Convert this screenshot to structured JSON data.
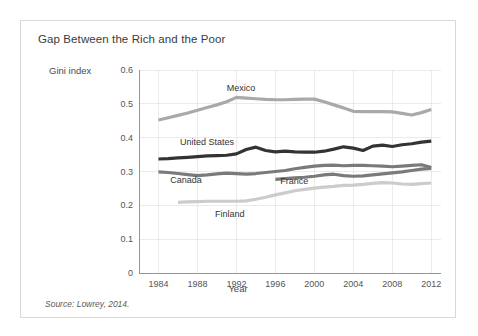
{
  "figure": {
    "title": "Gap Between the Rich and the Poor",
    "source": "Source: Lowrey, 2014."
  },
  "chart_data": {
    "type": "line",
    "title": "Gap Between the Rich and the Poor",
    "xlabel": "Year",
    "ylabel": "Gini index",
    "xlim": [
      1982,
      2013
    ],
    "ylim": [
      0,
      0.6
    ],
    "grid": true,
    "legend_position": "inline-labels",
    "xticks": [
      "1984",
      "1988",
      "1992",
      "1996",
      "2000",
      "2004",
      "2008",
      "2012"
    ],
    "xtick_values": [
      1984,
      1988,
      1992,
      1996,
      2000,
      2004,
      2008,
      2012
    ],
    "yticks": [
      "0",
      "0.1",
      "0.2",
      "0.3",
      "0.4",
      "0.5",
      "0.6"
    ],
    "ytick_values": [
      0,
      0.1,
      0.2,
      0.3,
      0.4,
      0.5,
      0.6
    ],
    "series": [
      {
        "name": "Mexico",
        "color": "#a9a9a9",
        "label_x": 1991,
        "label_y": 0.545,
        "x": [
          1984,
          1985,
          1986,
          1987,
          1988,
          1989,
          1990,
          1991,
          1992,
          1993,
          1994,
          1995,
          1996,
          1997,
          1998,
          1999,
          2000,
          2001,
          2002,
          2003,
          2004,
          2005,
          2006,
          2007,
          2008,
          2009,
          2010,
          2011,
          2012
        ],
        "values": [
          0.452,
          0.459,
          0.466,
          0.473,
          0.481,
          0.489,
          0.497,
          0.506,
          0.519,
          0.517,
          0.515,
          0.513,
          0.512,
          0.512,
          0.513,
          0.514,
          0.514,
          0.506,
          0.497,
          0.488,
          0.478,
          0.477,
          0.477,
          0.477,
          0.476,
          0.472,
          0.467,
          0.474,
          0.483
        ]
      },
      {
        "name": "United States",
        "color": "#333333",
        "label_x": 1986.2,
        "label_y": 0.385,
        "x": [
          1984,
          1985,
          1986,
          1987,
          1988,
          1989,
          1990,
          1991,
          1992,
          1993,
          1994,
          1995,
          1996,
          1997,
          1998,
          1999,
          2000,
          2001,
          2002,
          2003,
          2004,
          2005,
          2006,
          2007,
          2008,
          2009,
          2010,
          2011,
          2012
        ],
        "values": [
          0.337,
          0.338,
          0.34,
          0.342,
          0.344,
          0.346,
          0.347,
          0.348,
          0.352,
          0.365,
          0.372,
          0.362,
          0.358,
          0.36,
          0.358,
          0.357,
          0.357,
          0.36,
          0.366,
          0.373,
          0.369,
          0.362,
          0.375,
          0.378,
          0.374,
          0.379,
          0.382,
          0.387,
          0.39
        ]
      },
      {
        "name": "France",
        "color": "#7a7a7a",
        "label_x": 1996.5,
        "label_y": 0.268,
        "x": [
          1996,
          1997,
          1998,
          1999,
          2000,
          2001,
          2002,
          2003,
          2004,
          2005,
          2006,
          2007,
          2008,
          2009,
          2010,
          2011,
          2012
        ],
        "values": [
          0.277,
          0.279,
          0.281,
          0.283,
          0.286,
          0.29,
          0.292,
          0.288,
          0.286,
          0.287,
          0.29,
          0.293,
          0.296,
          0.299,
          0.303,
          0.307,
          0.309
        ]
      },
      {
        "name": "Canada",
        "color": "#7a7a7a",
        "label_x": 1985.2,
        "label_y": 0.272,
        "x": [
          1984,
          1985,
          1986,
          1987,
          1988,
          1989,
          1990,
          1991,
          1992,
          1993,
          1994,
          1995,
          1996,
          1997,
          1998,
          1999,
          2000,
          2001,
          2002,
          2003,
          2004,
          2005,
          2006,
          2007,
          2008,
          2009,
          2010,
          2011,
          2012
        ],
        "values": [
          0.299,
          0.297,
          0.294,
          0.291,
          0.288,
          0.29,
          0.293,
          0.295,
          0.294,
          0.292,
          0.294,
          0.297,
          0.3,
          0.303,
          0.308,
          0.312,
          0.316,
          0.318,
          0.319,
          0.317,
          0.318,
          0.318,
          0.317,
          0.316,
          0.314,
          0.316,
          0.318,
          0.32,
          0.312
        ]
      },
      {
        "name": "Finland",
        "color": "#cccccc",
        "label_x": 1989.8,
        "label_y": 0.172,
        "x": [
          1986,
          1987,
          1988,
          1989,
          1990,
          1991,
          1992,
          1993,
          1994,
          1995,
          1996,
          1997,
          1998,
          1999,
          2000,
          2001,
          2002,
          2003,
          2004,
          2005,
          2006,
          2007,
          2008,
          2009,
          2010,
          2011,
          2012
        ],
        "values": [
          0.209,
          0.21,
          0.211,
          0.212,
          0.212,
          0.212,
          0.212,
          0.213,
          0.218,
          0.224,
          0.231,
          0.237,
          0.243,
          0.247,
          0.251,
          0.254,
          0.256,
          0.259,
          0.26,
          0.262,
          0.265,
          0.267,
          0.266,
          0.263,
          0.262,
          0.264,
          0.266
        ]
      }
    ]
  }
}
